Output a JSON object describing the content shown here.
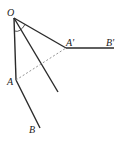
{
  "diagram": {
    "labels": {
      "O": "O",
      "A": "A",
      "B": "B",
      "A_prime": "A'",
      "B_prime": "B'"
    },
    "points": {
      "O": [
        14,
        18
      ],
      "A": [
        16,
        80
      ],
      "B": [
        40,
        128
      ],
      "A_prime": [
        66,
        48
      ],
      "B_prime": [
        114,
        48
      ],
      "bisector_end": [
        58,
        92
      ]
    },
    "segments": [
      {
        "from": "O",
        "to": "A",
        "style": "solid"
      },
      {
        "from": "A",
        "to": "B",
        "style": "solid"
      },
      {
        "from": "O",
        "to": "A_prime",
        "style": "solid"
      },
      {
        "from": "A_prime",
        "to": "B_prime",
        "style": "solid"
      },
      {
        "from": "O",
        "to": "bisector_end",
        "style": "solid"
      },
      {
        "from": "A",
        "to": "A_prime",
        "style": "dashed"
      }
    ],
    "colors": {
      "line": "#2a2a2a",
      "dashed": "#888888"
    }
  }
}
